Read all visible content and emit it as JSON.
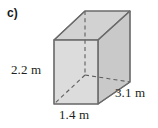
{
  "figure": {
    "part_label": "c)",
    "shape_name": "rectangular-prism",
    "faces": {
      "front_fill": "#dcdcdc",
      "top_fill": "#d2d2d2",
      "side_fill": "#c9c9c9",
      "edge_color": "#6b6b6b",
      "hidden_edge_color": "#6b6b6b"
    },
    "dimensions": [
      {
        "id": "height",
        "value": "2.2 m",
        "position": "left"
      },
      {
        "id": "width",
        "value": "1.4 m",
        "position": "bottom"
      },
      {
        "id": "depth",
        "value": "3.1 m",
        "position": "right"
      }
    ],
    "geometry": {
      "front_top_left": [
        54,
        40
      ],
      "front_top_right": [
        98,
        40
      ],
      "front_bottom_right": [
        98,
        104
      ],
      "front_bottom_left": [
        54,
        104
      ],
      "back_top_left": [
        85,
        11
      ],
      "back_top_right": [
        130,
        11
      ],
      "back_bottom_right": [
        130,
        82
      ],
      "back_bottom_left": [
        85,
        75
      ]
    }
  }
}
